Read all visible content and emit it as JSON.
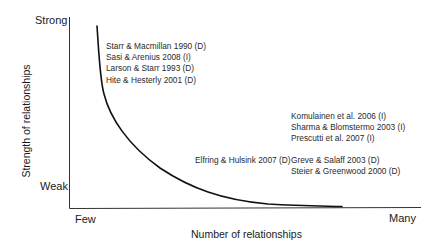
{
  "diagram": {
    "y_axis": {
      "title": "Strength of relationships",
      "top_label": "Strong",
      "bottom_label": "Weak"
    },
    "x_axis": {
      "title": "Number of relationships",
      "left_label": "Few",
      "right_label": "Many"
    },
    "curve": {
      "shape": "decreasing convex curve, steep at few relationships, flattening toward many"
    },
    "citation_groups": [
      {
        "position": "upper-left (strong ties, few relationships)",
        "items": [
          "Starr & Macmillan 1990 (D)",
          "Sasi & Arenius 2008 (I)",
          "Larson & Starr 1993 (D)",
          "Hite & Hesterly 2001 (D)"
        ]
      },
      {
        "position": "middle-right",
        "items": [
          "Komulainen et al. 2006 (I)",
          "Sharma & Blomstermo 2003 (I)",
          "Prescutti et al. 2007 (I)"
        ]
      },
      {
        "position": "middle along curve",
        "items": [
          "Elfring & Hulsink 2007 (D)"
        ]
      },
      {
        "position": "lower-right (weak ties, many relationships)",
        "items": [
          "Greve & Salaff 2003 (D)",
          "Steier & Greenwood 2000 (D)"
        ]
      }
    ]
  }
}
